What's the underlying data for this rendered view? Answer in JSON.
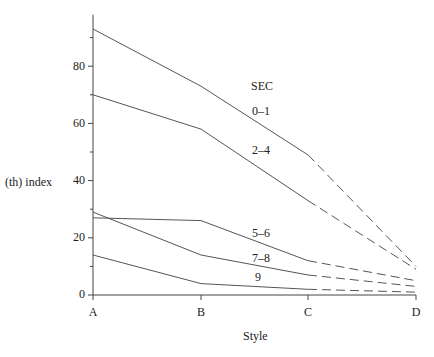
{
  "chart_data": {
    "type": "line",
    "title": "",
    "xlabel": "Style",
    "ylabel": "(th) index",
    "categories": [
      "A",
      "B",
      "C",
      "D"
    ],
    "ylim": [
      0,
      98
    ],
    "yticks": [
      0,
      20,
      40,
      60,
      80
    ],
    "minor_yticks": [
      10,
      30,
      50,
      70,
      90
    ],
    "grid": false,
    "legend_title": "SEC",
    "series": [
      {
        "name": "0–1",
        "values": [
          93,
          73,
          49,
          10
        ],
        "dashed_from": "C"
      },
      {
        "name": "2–4",
        "values": [
          70,
          58,
          33,
          9
        ],
        "dashed_from": "C"
      },
      {
        "name": "5–6",
        "values": [
          27,
          26,
          12,
          5
        ],
        "dashed_from": "C"
      },
      {
        "name": "7–8",
        "values": [
          29,
          14,
          7,
          3
        ],
        "dashed_from": "C"
      },
      {
        "name": "9",
        "values": [
          14,
          4,
          2,
          1
        ],
        "dashed_from": "C"
      }
    ],
    "line_color": "#555555"
  },
  "labels": {
    "ylabel": "(th) index",
    "xlabel": "Style",
    "legend_title": "SEC",
    "series_labels": [
      "0–1",
      "2–4",
      "5–6",
      "7–8",
      "9"
    ],
    "yticks": [
      "0",
      "20",
      "40",
      "60",
      "80"
    ],
    "categories": [
      "A",
      "B",
      "C",
      "D"
    ]
  }
}
